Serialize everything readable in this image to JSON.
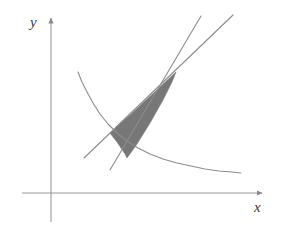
{
  "figure": {
    "background_color": "#ffffff",
    "axes": {
      "x_axis_label": "x",
      "y_axis_label": "y",
      "axis_color": "#9a9a9a",
      "origin_px": [
        51,
        193
      ],
      "x_axis_span_px": [
        22,
        266
      ],
      "y_axis_span_px": [
        14,
        222
      ],
      "arrowheads": [
        "x-positive",
        "y-positive"
      ],
      "ticks_shown": false,
      "gridlines_shown": false,
      "tick_labels": []
    },
    "curve": {
      "name": "hyperbola-branch",
      "description": "decreasing convex curve (rectangular hyperbola branch)",
      "stroke_color": "#8c8c8c",
      "stroke_width": 1,
      "points_px": [
        [
          78,
          72
        ],
        [
          82,
          82
        ],
        [
          87,
          92
        ],
        [
          93,
          103
        ],
        [
          100,
          114
        ],
        [
          108,
          124
        ],
        [
          117,
          133
        ],
        [
          127,
          141
        ],
        [
          138,
          148
        ],
        [
          150,
          154
        ],
        [
          163,
          159
        ],
        [
          177,
          163
        ],
        [
          191,
          166
        ],
        [
          205,
          169
        ],
        [
          219,
          171
        ],
        [
          232,
          172
        ],
        [
          241,
          173
        ]
      ]
    },
    "line_upper": {
      "name": "steeper-line",
      "description": "steeper straight line through the intersection point",
      "stroke_color": "#8c8c8c",
      "stroke_width": 1,
      "start_px": [
        110,
        170
      ],
      "end_px": [
        201,
        16
      ]
    },
    "line_lower": {
      "name": "shallower-line",
      "description": "shallower straight line through the intersection point",
      "stroke_color": "#8c8c8c",
      "stroke_width": 1,
      "start_px": [
        84,
        158
      ],
      "end_px": [
        233,
        15
      ]
    },
    "shaded_region": {
      "name": "shaded-area",
      "description": "curvilinear triangle bounded above-right by the apex, left by the curve and the two lines",
      "fill_color": "#777777",
      "apex_px": [
        176,
        72
      ],
      "lower_left_px": [
        110,
        133
      ],
      "lower_right_px": [
        127,
        158
      ],
      "outline_px": [
        [
          176,
          72
        ],
        [
          160,
          87
        ],
        [
          145,
          101
        ],
        [
          130,
          115
        ],
        [
          118,
          125
        ],
        [
          110,
          133
        ],
        [
          113,
          137
        ],
        [
          117,
          142
        ],
        [
          121,
          148
        ],
        [
          125,
          154
        ],
        [
          127,
          158
        ],
        [
          137,
          144
        ],
        [
          150,
          123
        ],
        [
          163,
          100
        ],
        [
          172,
          82
        ],
        [
          176,
          72
        ]
      ]
    }
  }
}
